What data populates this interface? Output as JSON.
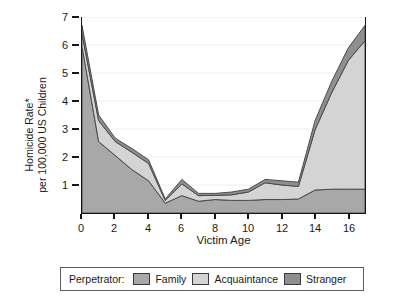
{
  "chart_data": {
    "type": "area",
    "stacked": true,
    "title": "",
    "xlabel": "Victim Age",
    "ylabel": "Homicide Rate* per 100,000 US Children",
    "ylabel_lines": [
      "Homicide Rate*",
      "per 100,000 US Children"
    ],
    "xlim": [
      0,
      17
    ],
    "ylim": [
      0,
      7
    ],
    "xticks": [
      0,
      2,
      4,
      6,
      8,
      10,
      12,
      14,
      16
    ],
    "yticks": [
      1,
      2,
      3,
      4,
      5,
      6,
      7
    ],
    "grid": "horizontal-faint",
    "legend_position": "bottom",
    "legend_title": "Perpetrator:",
    "x": [
      0,
      1,
      2,
      3,
      4,
      5,
      6,
      7,
      8,
      9,
      10,
      11,
      12,
      13,
      14,
      15,
      16,
      17
    ],
    "series": [
      {
        "name": "Family",
        "color": "#a8a8a8",
        "values": [
          5.95,
          2.55,
          2.05,
          1.55,
          1.15,
          0.35,
          0.62,
          0.42,
          0.48,
          0.45,
          0.45,
          0.48,
          0.48,
          0.5,
          0.82,
          0.85,
          0.85,
          0.85
        ]
      },
      {
        "name": "Acquaintance",
        "color": "#d4d4d4",
        "values": [
          0.45,
          0.75,
          0.5,
          0.62,
          0.62,
          0.1,
          0.42,
          0.2,
          0.15,
          0.2,
          0.3,
          0.6,
          0.52,
          0.45,
          2.15,
          3.45,
          4.6,
          5.3
        ]
      },
      {
        "name": "Stranger",
        "color": "#8f8f8f",
        "values": [
          0.3,
          0.2,
          0.12,
          0.13,
          0.13,
          0.05,
          0.16,
          0.08,
          0.07,
          0.1,
          0.1,
          0.12,
          0.15,
          0.15,
          0.33,
          0.4,
          0.45,
          0.55
        ]
      }
    ],
    "totals": [
      6.7,
      3.5,
      2.67,
      2.3,
      1.9,
      0.5,
      1.2,
      0.7,
      0.7,
      0.75,
      0.85,
      1.2,
      1.15,
      1.1,
      3.3,
      4.7,
      5.9,
      6.7
    ]
  },
  "axes": {
    "y_tick_labels": [
      "1",
      "2",
      "3",
      "4",
      "5",
      "6",
      "7"
    ],
    "x_tick_labels": [
      "0",
      "2",
      "4",
      "6",
      "8",
      "10",
      "12",
      "14",
      "16"
    ],
    "x_title": "Victim Age",
    "y_title_line1": "Homicide Rate*",
    "y_title_line2": "per 100,000 US Children"
  },
  "legend": {
    "title": "Perpetrator:",
    "items": [
      {
        "label": "Family",
        "color": "#a8a8a8"
      },
      {
        "label": "Acquaintance",
        "color": "#d4d4d4"
      },
      {
        "label": "Stranger",
        "color": "#8f8f8f"
      }
    ]
  },
  "colors": {
    "axis": "#161616",
    "grid": "#eeeeee",
    "outline": "#4a4a4a",
    "background": "#ffffff"
  }
}
